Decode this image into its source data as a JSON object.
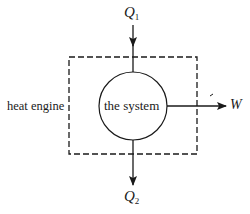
{
  "diagram": {
    "system_label": "the system",
    "engine_label": "heat engine",
    "heat_in": {
      "symbol": "Q",
      "subscript": "1"
    },
    "heat_out": {
      "symbol": "Q",
      "subscript": "2"
    },
    "work": {
      "symbol": "W"
    },
    "colors": {
      "stroke": "#1a1a1a",
      "background": "#ffffff"
    }
  }
}
